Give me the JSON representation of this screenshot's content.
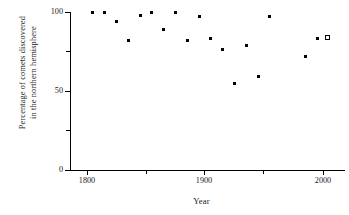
{
  "chart_data": {
    "type": "scatter",
    "title": "",
    "xlabel": "Year",
    "ylabel": "Percentage of comets discovered in the northern hemisphere",
    "ylabel_lines": [
      "Percentage of comets discovered",
      "in the northern hemisphere"
    ],
    "xlim": [
      1780,
      2010
    ],
    "ylim": [
      0,
      100
    ],
    "grid": false,
    "legend": null,
    "xticks": [
      1800,
      1850,
      1900,
      1950,
      2000
    ],
    "xtick_labels": [
      "1800",
      "",
      "1900",
      "",
      "2000"
    ],
    "xticks_minor": [
      1850,
      1950
    ],
    "yticks": [
      0,
      25,
      50,
      75,
      100
    ],
    "ytick_labels": [
      "0",
      "",
      "50",
      "",
      "100"
    ],
    "yticks_minor": [
      25,
      75
    ],
    "series": [
      {
        "name": "observed",
        "marker": "filled-square",
        "color": "#000000",
        "points": [
          {
            "x": 1805,
            "y": 100
          },
          {
            "x": 1815,
            "y": 100
          },
          {
            "x": 1825,
            "y": 94
          },
          {
            "x": 1835,
            "y": 82
          },
          {
            "x": 1845,
            "y": 98
          },
          {
            "x": 1855,
            "y": 100
          },
          {
            "x": 1865,
            "y": 89
          },
          {
            "x": 1875,
            "y": 100
          },
          {
            "x": 1885,
            "y": 82
          },
          {
            "x": 1895,
            "y": 97
          },
          {
            "x": 1905,
            "y": 83
          },
          {
            "x": 1915,
            "y": 76
          },
          {
            "x": 1925,
            "y": 55
          },
          {
            "x": 1935,
            "y": 79
          },
          {
            "x": 1945,
            "y": 59
          },
          {
            "x": 1955,
            "y": 97
          },
          {
            "x": 1985,
            "y": 72
          },
          {
            "x": 1995,
            "y": 83
          }
        ]
      },
      {
        "name": "projected",
        "marker": "open-square",
        "color": "#000000",
        "points": [
          {
            "x": 2004,
            "y": 84
          }
        ]
      }
    ]
  },
  "axes": {
    "x_label": "Year",
    "y_label_line1": "Percentage of comets discovered",
    "y_label_line2": "in the northern hemisphere",
    "x_tick_1800": "1800",
    "x_tick_1900": "1900",
    "x_tick_2000": "2000",
    "y_tick_0": "0",
    "y_tick_50": "50",
    "y_tick_100": "100"
  }
}
